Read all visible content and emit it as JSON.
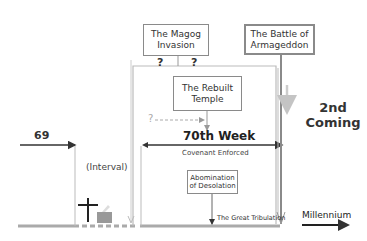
{
  "diagram": {
    "events": {
      "magog": "The Magog Invasion",
      "armageddon": "The Battle of Armageddon",
      "rebuilt_temple": "The Rebuilt Temple",
      "abomination": "Abomination of Desolation"
    },
    "question_marks": [
      "?",
      "?",
      "?"
    ],
    "labels": {
      "sixty_nine": "69",
      "interval": "(Interval)",
      "seventieth_week": "70th Week",
      "covenant": "Covenant Enforced",
      "great_tribulation": "The Great Tribulation",
      "second_coming_line1": "2nd",
      "second_coming_line2": "Coming",
      "millennium": "Millennium"
    },
    "icons": [
      "cross-icon",
      "altar-icon"
    ],
    "colors": {
      "dark_line": "#333333",
      "gray_line": "#999999",
      "light_line": "#c8c8c8",
      "box_border": "#8a8a8a"
    }
  }
}
